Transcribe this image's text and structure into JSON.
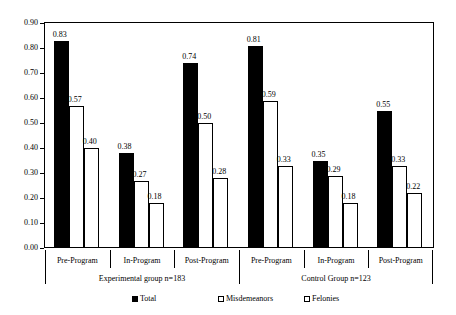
{
  "chart_data": {
    "type": "bar",
    "title": "",
    "subtitle": "",
    "xlabel": "",
    "ylabel": "",
    "ylim": [
      0.0,
      0.9
    ],
    "ytick_labels": [
      "0.00",
      "0.10",
      "0.20",
      "0.30",
      "0.40",
      "0.50",
      "0.60",
      "0.70",
      "0.80",
      "0.90"
    ],
    "ytick_values": [
      0.0,
      0.1,
      0.2,
      0.3,
      0.4,
      0.5,
      0.6,
      0.7,
      0.8,
      0.9
    ],
    "grid": false,
    "legend_position": "bottom",
    "categories": [
      "Pre-Program",
      "In-Program",
      "Post-Program",
      "Pre-Program",
      "In-Program",
      "Post-Program"
    ],
    "group_labels": [
      "Experimental group n=183",
      "Control Group n=123"
    ],
    "groups": [
      {
        "label": "Experimental group n=183",
        "categories": [
          "Pre-Program",
          "In-Program",
          "Post-Program"
        ],
        "values": {
          "Total": [
            0.83,
            0.38,
            0.74
          ],
          "Misdemeanors": [
            0.57,
            0.27,
            0.5
          ],
          "Felonies": [
            0.4,
            0.18,
            0.28
          ]
        }
      },
      {
        "label": "Control Group n=123",
        "categories": [
          "Pre-Program",
          "In-Program",
          "Post-Program"
        ],
        "values": {
          "Total": [
            0.81,
            0.35,
            0.55
          ],
          "Misdemeanors": [
            0.59,
            0.29,
            0.33
          ],
          "Felonies": [
            0.33,
            0.18,
            0.22
          ]
        }
      }
    ],
    "series": [
      {
        "name": "Total",
        "fill": "solid-black",
        "color": "#000000",
        "values": [
          0.83,
          0.38,
          0.74,
          0.81,
          0.35,
          0.55
        ],
        "labels": [
          "0.83",
          "0.38",
          "0.74",
          "0.81",
          "0.35",
          "0.55"
        ]
      },
      {
        "name": "Misdemeanors",
        "fill": "dotted",
        "color": "#ffffff",
        "values": [
          0.57,
          0.27,
          0.5,
          0.59,
          0.29,
          0.33
        ],
        "labels": [
          "0.57",
          "0.27",
          "0.50",
          "0.59",
          "0.29",
          "0.33"
        ]
      },
      {
        "name": "Felonies",
        "fill": "white",
        "color": "#ffffff",
        "values": [
          0.4,
          0.18,
          0.28,
          0.33,
          0.18,
          0.22
        ],
        "labels": [
          "0.40",
          "0.18",
          "0.28",
          "0.33",
          "0.18",
          "0.22"
        ]
      }
    ],
    "legend": [
      {
        "label": "Total",
        "swatch": "solid-black"
      },
      {
        "label": "Misdemeanors",
        "swatch": "dotted"
      },
      {
        "label": "Felonies",
        "swatch": "white"
      }
    ]
  }
}
